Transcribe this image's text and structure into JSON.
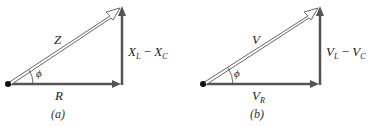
{
  "colors": {
    "vector": "#555555",
    "outline": "#666666",
    "dot": "#111111",
    "text": "#222222",
    "background": "#ffffff"
  },
  "panels": [
    {
      "id": "a",
      "caption": "(a)",
      "hypotenuse_label": "Z",
      "horizontal_label": "R",
      "vertical_label_parts": [
        "X",
        "L",
        " − ",
        "X",
        "C"
      ],
      "angle_label": "ϕ"
    },
    {
      "id": "b",
      "caption": "(b)",
      "hypotenuse_label": "V",
      "horizontal_label_parts": [
        "V",
        "R"
      ],
      "vertical_label_parts": [
        "V",
        "L",
        " − ",
        "V",
        "C"
      ],
      "angle_label": "ϕ"
    }
  ]
}
